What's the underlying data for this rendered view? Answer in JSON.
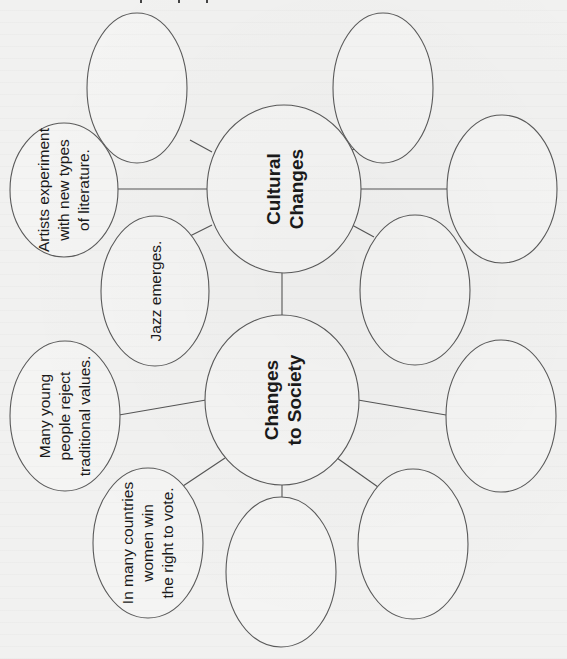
{
  "diagram": {
    "type": "concept-web",
    "orientation": "rotated-90-ccw",
    "colors": {
      "background": "#f1f1f0",
      "stroke": "#5a5a5a",
      "text": "#1a1a1a"
    },
    "hubs": [
      {
        "id": "cultural",
        "lines": [
          "Cultural",
          "Changes"
        ],
        "cx": 284,
        "cy": 189,
        "rx": 77,
        "ry": 84
      },
      {
        "id": "society",
        "lines": [
          "Changes",
          "to Society"
        ],
        "cx": 282,
        "cy": 400,
        "rx": 77,
        "ry": 85
      }
    ],
    "nodes": [
      {
        "id": "cultural-top-left",
        "hub": "cultural",
        "lines": [],
        "cx": 137,
        "cy": 88,
        "rx": 50,
        "ry": 75
      },
      {
        "id": "cultural-artists",
        "hub": "cultural",
        "lines": [
          "Artists experiment",
          "with new types",
          "of literature."
        ],
        "cx": 64,
        "cy": 190,
        "rx": 54,
        "ry": 67
      },
      {
        "id": "cultural-jazz",
        "hub": "cultural",
        "lines": [
          "Jazz emerges."
        ],
        "cx": 155,
        "cy": 291,
        "rx": 54,
        "ry": 75
      },
      {
        "id": "cultural-top-right",
        "hub": "cultural",
        "lines": [],
        "cx": 383,
        "cy": 88,
        "rx": 50,
        "ry": 75
      },
      {
        "id": "cultural-right",
        "hub": "cultural",
        "lines": [],
        "cx": 502,
        "cy": 189,
        "rx": 55,
        "ry": 74
      },
      {
        "id": "cultural-lower-right",
        "hub": "cultural",
        "lines": [],
        "cx": 415,
        "cy": 290,
        "rx": 55,
        "ry": 75
      },
      {
        "id": "society-young",
        "hub": "society",
        "lines": [
          "Many young",
          "people reject",
          "traditional values."
        ],
        "cx": 65,
        "cy": 416,
        "rx": 55,
        "ry": 75
      },
      {
        "id": "society-women",
        "hub": "society",
        "lines": [
          "In many countries",
          "women win",
          "the right to vote."
        ],
        "cx": 148,
        "cy": 543,
        "rx": 55,
        "ry": 75
      },
      {
        "id": "society-bottom",
        "hub": "society",
        "lines": [],
        "cx": 281,
        "cy": 572,
        "rx": 55,
        "ry": 75
      },
      {
        "id": "society-bottom-right",
        "hub": "society",
        "lines": [],
        "cx": 413,
        "cy": 544,
        "rx": 55,
        "ry": 75
      },
      {
        "id": "society-right",
        "hub": "society",
        "lines": [],
        "cx": 501,
        "cy": 416,
        "rx": 55,
        "ry": 76
      }
    ],
    "connectors": [
      {
        "from": "cultural",
        "to": "cultural-top-left",
        "x1": 212,
        "y1": 152,
        "x2": 190,
        "y2": 140
      },
      {
        "from": "cultural",
        "to": "cultural-artists",
        "x1": 207,
        "y1": 189,
        "x2": 118,
        "y2": 189
      },
      {
        "from": "cultural",
        "to": "cultural-jazz",
        "x1": 212,
        "y1": 225,
        "x2": 190,
        "y2": 236
      },
      {
        "from": "cultural",
        "to": "cultural-top-right",
        "x1": 352,
        "y1": 150,
        "x2": 375,
        "y2": 140
      },
      {
        "from": "cultural",
        "to": "cultural-right",
        "x1": 360,
        "y1": 189,
        "x2": 447,
        "y2": 189
      },
      {
        "from": "cultural",
        "to": "cultural-lower-right",
        "x1": 352,
        "y1": 225,
        "x2": 374,
        "y2": 237
      },
      {
        "from": "cultural",
        "to": "society",
        "x1": 282,
        "y1": 273,
        "x2": 282,
        "y2": 315
      },
      {
        "from": "society",
        "to": "society-young",
        "x1": 206,
        "y1": 400,
        "x2": 119,
        "y2": 415
      },
      {
        "from": "society",
        "to": "society-women",
        "x1": 225,
        "y1": 458,
        "x2": 183,
        "y2": 486
      },
      {
        "from": "society",
        "to": "society-bottom",
        "x1": 282,
        "y1": 485,
        "x2": 282,
        "y2": 497
      },
      {
        "from": "society",
        "to": "society-bottom-right",
        "x1": 337,
        "y1": 458,
        "x2": 378,
        "y2": 487
      },
      {
        "from": "society",
        "to": "society-right",
        "x1": 358,
        "y1": 400,
        "x2": 446,
        "y2": 415
      }
    ]
  },
  "labels": {
    "cultural_line1": "Cultural",
    "cultural_line2": "Changes",
    "society_line1": "Changes",
    "society_line2": "to Society",
    "artists_line1": "Artists experiment",
    "artists_line2": "with new types",
    "artists_line3": "of literature.",
    "jazz_line1": "Jazz emerges.",
    "young_line1": "Many young",
    "young_line2": "people reject",
    "young_line3": "traditional values.",
    "women_line1": "In many countries",
    "women_line2": "women win",
    "women_line3": "the right to vote."
  }
}
